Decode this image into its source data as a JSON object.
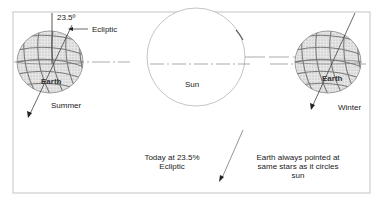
{
  "diagram": {
    "type": "earth-orbit-axial-tilt",
    "frame": {
      "stroke": "#bdbdbd"
    },
    "colors": {
      "globe_fill": "#d9d9d9",
      "globe_grid": "#8a8a8a",
      "line": "#555555",
      "sun_stroke": "#b0b0b0"
    },
    "labels": {
      "tilt_angle": "23.5º",
      "ecliptic_pointer": "Ecliptic",
      "earth_left": "Earth",
      "earth_right": "Earth",
      "sun": "Sun",
      "summer": "Summer",
      "winter": "Winter",
      "today_line1": "Today at 23.5%",
      "today_line2": "Ecliptic",
      "note_line1": "Earth always pointed at",
      "note_line2": "same stars as it circles",
      "note_line3": "sun"
    }
  }
}
